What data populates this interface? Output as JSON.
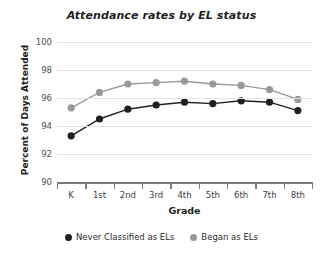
{
  "chart_data": {
    "type": "line",
    "title": "Attendance rates by EL status",
    "xlabel": "Grade",
    "ylabel": "Percent of Days Attended",
    "categories": [
      "K",
      "1st",
      "2nd",
      "3rd",
      "4th",
      "5th",
      "6th",
      "7th",
      "8th"
    ],
    "ylim": [
      90,
      100
    ],
    "yticks": [
      90,
      92,
      94,
      96,
      98,
      100
    ],
    "ytick_labels": [
      "90",
      "92",
      "94",
      "96",
      "98",
      "100"
    ],
    "grid": true,
    "legend_position": "bottom",
    "series": [
      {
        "name": "Never Classified as ELs",
        "color": "#231f20",
        "values": [
          93.3,
          94.5,
          95.2,
          95.5,
          95.7,
          95.6,
          95.8,
          95.7,
          95.1
        ]
      },
      {
        "name": "Began as ELs",
        "color": "#999999",
        "values": [
          95.3,
          96.4,
          97.0,
          97.1,
          97.2,
          97.0,
          96.9,
          96.6,
          95.9
        ]
      }
    ]
  },
  "axes": {
    "axis_color": "#7a7a7a",
    "grid_color": "#e3e3e3"
  }
}
